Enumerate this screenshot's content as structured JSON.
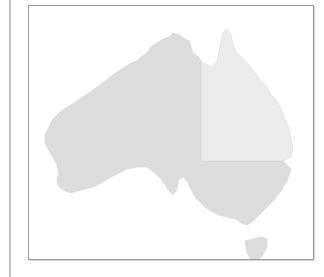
{
  "map": {
    "subject": "Australia",
    "regions": [
      {
        "name": "Western Australia",
        "fill": "#dddddd"
      },
      {
        "name": "Northern Territory",
        "fill": "#dddddd"
      },
      {
        "name": "South Australia",
        "fill": "#dddddd"
      },
      {
        "name": "Queensland",
        "fill": "#ebebeb"
      },
      {
        "name": "New South Wales",
        "fill": "#dddddd"
      },
      {
        "name": "Victoria",
        "fill": "#dddddd"
      },
      {
        "name": "Tasmania",
        "fill": "#dddddd"
      }
    ],
    "highlighted_region": "Queensland",
    "colors": {
      "land": "#dddddd",
      "highlight": "#ebebeb",
      "frame_border": "#9a9a9a",
      "background": "#ffffff"
    }
  }
}
